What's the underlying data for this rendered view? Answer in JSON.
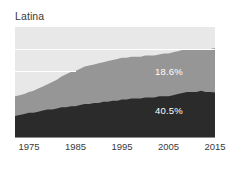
{
  "chart_data": {
    "type": "area",
    "title": "Latina",
    "xlabel": "",
    "ylabel": "",
    "stacked": true,
    "normalized_percent": true,
    "grid": true,
    "gridlines_y": [
      80,
      60
    ],
    "legend_position": "inline-labels",
    "xlim": [
      1972,
      2015
    ],
    "ylim": [
      0,
      100
    ],
    "tick_labels": [
      "1975",
      "1985",
      "1995",
      "2005",
      "2015"
    ],
    "tick_values": [
      1975,
      1985,
      1995,
      2005,
      2015
    ],
    "x": [
      1972,
      1973,
      1974,
      1975,
      1976,
      1977,
      1978,
      1979,
      1980,
      1981,
      1982,
      1983,
      1984,
      1985,
      1986,
      1987,
      1988,
      1989,
      1990,
      1991,
      1992,
      1993,
      1994,
      1995,
      1996,
      1997,
      1998,
      1999,
      2000,
      2001,
      2002,
      2003,
      2004,
      2005,
      2006,
      2007,
      2008,
      2009,
      2010,
      2011,
      2012,
      2013,
      2014,
      2015
    ],
    "series": [
      {
        "name": "dark-band",
        "color": "#2b2b2b",
        "label": "40.5%",
        "label_value": 40.5,
        "values": [
          19,
          20,
          21,
          22,
          22,
          23,
          24,
          25,
          25,
          26,
          27,
          27,
          28,
          28,
          29,
          30,
          30,
          31,
          31,
          32,
          32,
          33,
          33,
          34,
          34,
          35,
          35,
          35,
          36,
          36,
          36,
          37,
          37,
          37,
          38,
          39,
          40,
          41,
          41,
          41,
          42,
          41,
          41,
          40.5
        ]
      },
      {
        "name": "mid-band",
        "color": "#969696",
        "label": "18.6%",
        "label_value": 18.6,
        "values": [
          18,
          18,
          18,
          19,
          20,
          21,
          22,
          23,
          25,
          26,
          28,
          30,
          31,
          32,
          33,
          34,
          35,
          35,
          36,
          36,
          37,
          37,
          38,
          38,
          38,
          38,
          38,
          38,
          38,
          38,
          38,
          38,
          39,
          39,
          39,
          39,
          39,
          39,
          39,
          39,
          38,
          39,
          39,
          18.6
        ]
      },
      {
        "name": "light-band",
        "color": "#e8e8e8",
        "label": "",
        "values": [
          63,
          62,
          61,
          59,
          58,
          56,
          54,
          52,
          50,
          48,
          45,
          43,
          41,
          40,
          38,
          36,
          35,
          34,
          33,
          32,
          31,
          30,
          29,
          28,
          28,
          27,
          27,
          27,
          26,
          26,
          26,
          25,
          24,
          24,
          23,
          22,
          21,
          20,
          20,
          20,
          20,
          20,
          20,
          40.9
        ]
      }
    ],
    "band_tops": {
      "dark_top_percent": [
        19,
        20,
        21,
        22,
        22,
        23,
        24,
        25,
        25,
        26,
        27,
        27,
        28,
        28,
        29,
        30,
        30,
        31,
        31,
        32,
        32,
        33,
        33,
        34,
        34,
        35,
        35,
        35,
        36,
        36,
        36,
        37,
        37,
        37,
        38,
        39,
        40,
        41,
        41,
        41,
        42,
        41,
        41,
        40.5
      ],
      "mid_top_percent": [
        37,
        38,
        39,
        41,
        42,
        44,
        46,
        48,
        50,
        52,
        55,
        57,
        59,
        60,
        62,
        64,
        65,
        66,
        67,
        68,
        69,
        70,
        71,
        72,
        72,
        73,
        73,
        73,
        74,
        74,
        74,
        75,
        76,
        76,
        77,
        78,
        79,
        80,
        80,
        80,
        80,
        80,
        80,
        81
      ]
    }
  },
  "colors": {
    "light_band": "#e8e8e8",
    "mid_band": "#969696",
    "dark_band": "#2b2b2b",
    "gridline": "#ffffff",
    "axis": "#8c8c8c",
    "text": "#3a3a3a",
    "label_text": "#ffffff",
    "background": "#ffffff"
  }
}
